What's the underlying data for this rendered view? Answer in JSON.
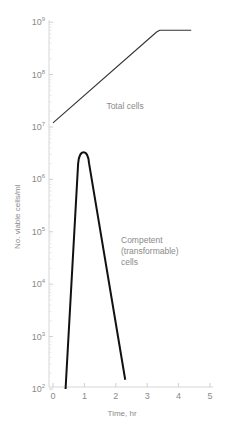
{
  "chart_data": {
    "type": "line",
    "title": "",
    "xlabel": "Time, hr",
    "ylabel": "No. viable cells/ml",
    "yscale": "log",
    "xlim": [
      0,
      5
    ],
    "ylim": [
      100,
      1000000000
    ],
    "xticks": [
      "0",
      "1",
      "2",
      "3",
      "4",
      "5"
    ],
    "yticks": [
      {
        "base": "10",
        "exp": "2"
      },
      {
        "base": "10",
        "exp": "3"
      },
      {
        "base": "10",
        "exp": "4"
      },
      {
        "base": "10",
        "exp": "5"
      },
      {
        "base": "10",
        "exp": "6"
      },
      {
        "base": "10",
        "exp": "7"
      },
      {
        "base": "10",
        "exp": "8"
      },
      {
        "base": "10",
        "exp": "9"
      }
    ],
    "grid": false,
    "legend": "inline annotations",
    "series": [
      {
        "name": "Total cells",
        "label": "Total cells",
        "points": [
          {
            "x": 0,
            "y": 12000000
          },
          {
            "x": 3.3,
            "y": 650000000
          },
          {
            "x": 3.4,
            "y": 700000000
          },
          {
            "x": 4.4,
            "y": 700000000
          }
        ]
      },
      {
        "name": "Competent (transformable) cells",
        "label_lines": [
          "Competent",
          "(transformable)",
          "cells"
        ],
        "points": [
          {
            "x": 0.4,
            "y": 100
          },
          {
            "x": 0.8,
            "y": 2000000
          },
          {
            "x": 1.0,
            "y": 3000000
          },
          {
            "x": 1.15,
            "y": 2000000
          },
          {
            "x": 2.3,
            "y": 150
          }
        ]
      }
    ]
  }
}
